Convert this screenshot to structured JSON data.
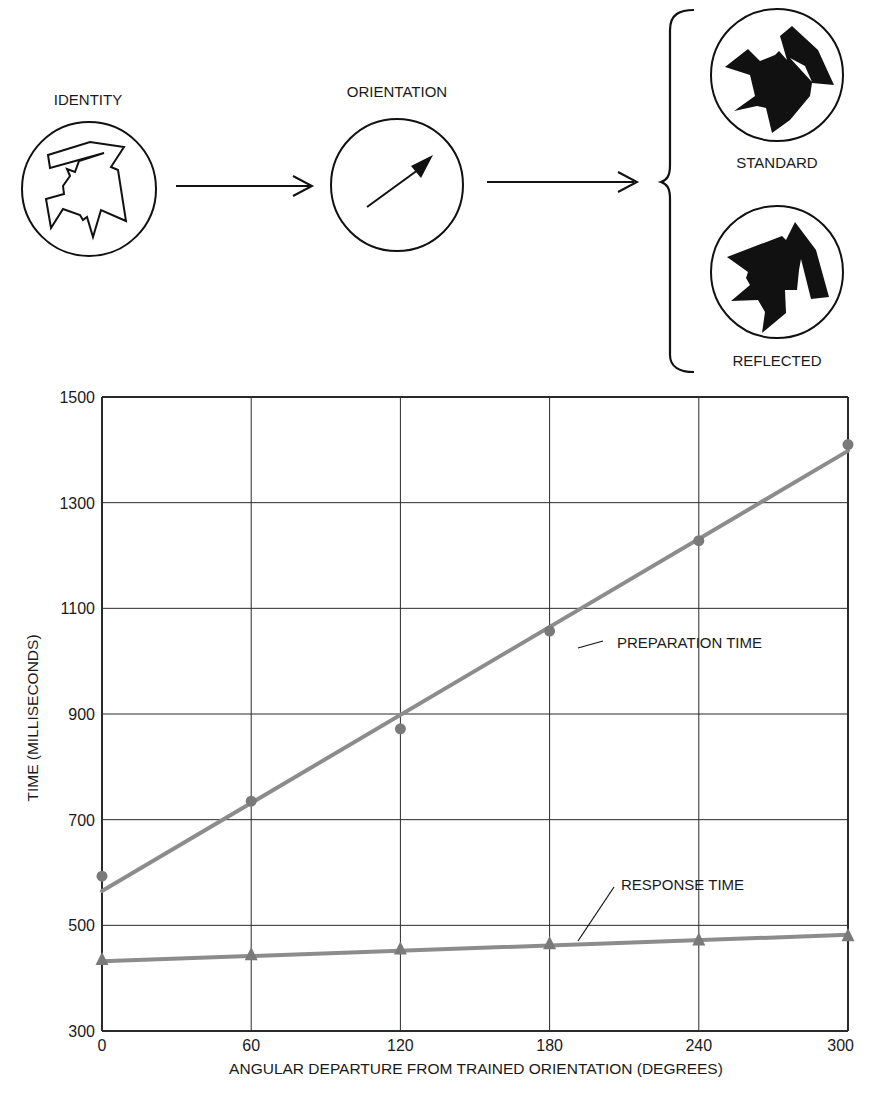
{
  "diagram": {
    "identity_label": "IDENTITY",
    "orientation_label": "ORIENTATION",
    "standard_label": "STANDARD",
    "reflected_label": "REFLECTED"
  },
  "chart_data": {
    "type": "line",
    "title": "",
    "xlabel": "ANGULAR DEPARTURE FROM TRAINED ORIENTATION (DEGREES)",
    "ylabel": "TIME (MILLISECONDS)",
    "x": [
      0,
      60,
      120,
      180,
      240,
      300
    ],
    "xlim": [
      0,
      300
    ],
    "ylim": [
      300,
      1500
    ],
    "xticks": [
      "0",
      "60",
      "120",
      "180",
      "240",
      "300"
    ],
    "yticks": [
      "300",
      "500",
      "700",
      "900",
      "1100",
      "1300",
      "1500"
    ],
    "ytick_values": [
      300,
      500,
      700,
      900,
      1100,
      1300,
      1500
    ],
    "grid": true,
    "legend": "inline annotations",
    "series": [
      {
        "name": "PREPARATION TIME",
        "marker": "circle",
        "values": [
          593,
          735,
          872,
          1057,
          1228,
          1410
        ],
        "fit_line": [
          565,
          1398
        ]
      },
      {
        "name": "RESPONSE TIME",
        "marker": "triangle",
        "values": [
          435,
          444,
          455,
          465,
          472,
          480
        ],
        "fit_line": [
          432,
          482
        ]
      }
    ],
    "colors": {
      "series_line": "#8c8c8c",
      "marker": "#7a7a7a",
      "grid": "#2a2a2a"
    }
  }
}
